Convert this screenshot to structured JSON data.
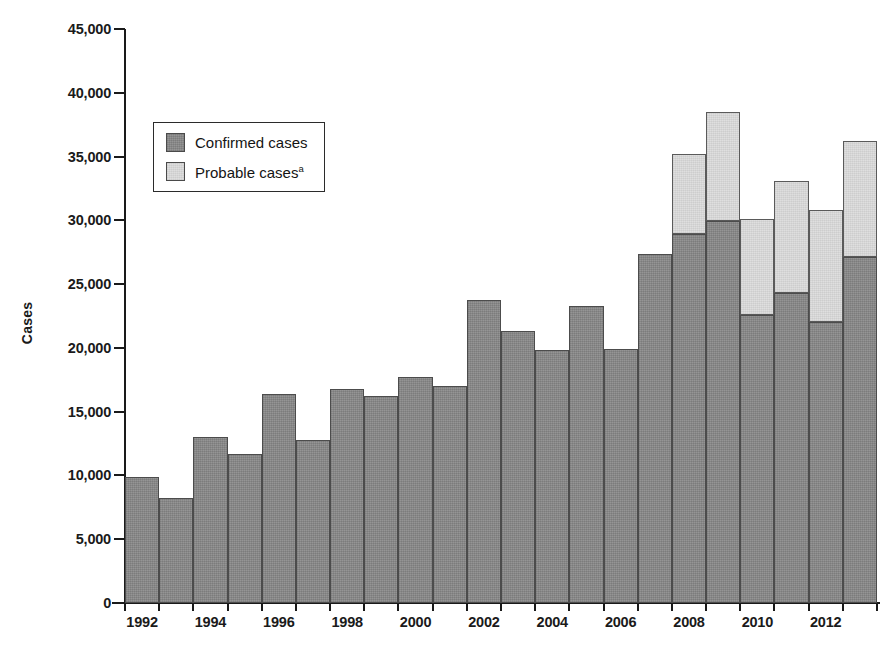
{
  "chart_data": {
    "type": "bar",
    "subtype": "stacked-bar",
    "title": "",
    "xlabel": "",
    "ylabel": "Cases",
    "ylim": [
      0,
      45000
    ],
    "ytick_step": 5000,
    "ytick_labels": [
      "45,000",
      "40,000",
      "35,000",
      "30,000",
      "25,000",
      "20,000",
      "15,000",
      "10,000",
      "5,000",
      "0"
    ],
    "ytick_values": [
      45000,
      40000,
      35000,
      30000,
      25000,
      20000,
      15000,
      10000,
      5000,
      0
    ],
    "grid": false,
    "legend_position": "upper-left-inside",
    "categories": [
      1992,
      1993,
      1994,
      1995,
      1996,
      1997,
      1998,
      1999,
      2000,
      2001,
      2002,
      2003,
      2004,
      2005,
      2006,
      2007,
      2008,
      2009,
      2010,
      2011,
      2012,
      2013
    ],
    "xtick_labels": [
      "1992",
      "1994",
      "1996",
      "1998",
      "2000",
      "2002",
      "2004",
      "2006",
      "2008",
      "2010",
      "2012"
    ],
    "xtick_values": [
      1992,
      1994,
      1996,
      1998,
      2000,
      2002,
      2004,
      2006,
      2008,
      2010,
      2012
    ],
    "series": [
      {
        "name": "Confirmed cases",
        "color": "#8a8a8a",
        "values": [
          9900,
          8200,
          13000,
          11700,
          16400,
          12800,
          16800,
          16200,
          17700,
          17000,
          23750,
          21300,
          19800,
          23300,
          19900,
          27400,
          28900,
          29950,
          22550,
          24300,
          22000,
          27150
        ]
      },
      {
        "name": "Probable cases",
        "color": "#dcdcdc",
        "footnote_marker": "a",
        "values": [
          0,
          0,
          0,
          0,
          0,
          0,
          0,
          0,
          0,
          0,
          0,
          0,
          0,
          0,
          0,
          0,
          6300,
          8550,
          7550,
          8750,
          8800,
          9100
        ]
      }
    ],
    "totals": [
      9900,
      8200,
      13000,
      11700,
      16400,
      12800,
      16800,
      16200,
      17700,
      17000,
      23750,
      21300,
      19800,
      23300,
      19900,
      27400,
      35200,
      38500,
      30100,
      33050,
      30800,
      36250
    ]
  },
  "legend": {
    "items": [
      {
        "label": "Confirmed cases",
        "marker": "",
        "swatch": "#8a8a8a"
      },
      {
        "label": "Probable cases",
        "marker": "a",
        "swatch": "#dcdcdc"
      }
    ]
  },
  "axes": {
    "y_title": "Cases"
  }
}
